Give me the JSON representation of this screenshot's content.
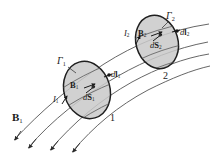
{
  "figure": {
    "type": "physics-diagram",
    "canvas": {
      "width": 211,
      "height": 153
    },
    "colors": {
      "background": "#ffffff",
      "stroke": "#2b2b2b",
      "surface_fill": "#c9c9c9",
      "surface_stroke": "#1f1f1f",
      "field_line": "#4a4a4a",
      "label": "#1a1a1a"
    }
  },
  "labels": {
    "contour_1": {
      "base": "Γ",
      "sub": "1"
    },
    "contour_2": {
      "base": "Γ",
      "sub": "2"
    },
    "field_1": {
      "base": "B",
      "sub": "1"
    },
    "field_2": {
      "base": "B",
      "sub": "2"
    },
    "area_1": {
      "base": "dS",
      "sub": "1"
    },
    "area_2": {
      "base": "dS",
      "sub": "2"
    },
    "length_1": {
      "base": "dl",
      "sub": "1"
    },
    "length_2": {
      "base": "dl",
      "sub": "2"
    },
    "current_1": {
      "base": "I",
      "sub": "1"
    },
    "current_2": {
      "base": "I",
      "sub": "2"
    },
    "source_field": {
      "base": "B",
      "sub": "1"
    },
    "circuit_number_1": "1",
    "circuit_number_2": "2"
  },
  "elements": {
    "surface_1_name": "circuit-surface-1",
    "surface_2_name": "circuit-surface-2",
    "field_line_count": 4,
    "arrowhead_count_bottom": 3
  }
}
